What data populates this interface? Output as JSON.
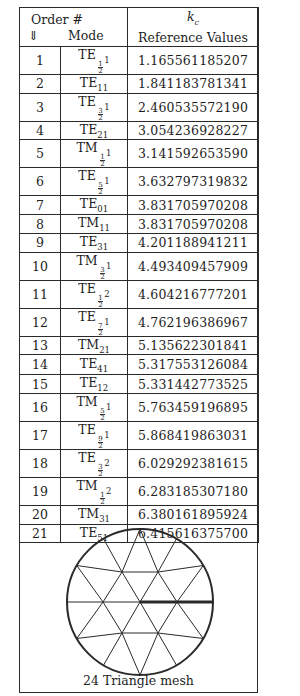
{
  "table": {
    "header": {
      "order_label": "Order #",
      "order_arrow": "⇓",
      "mode_label": "Mode",
      "kc_symbol": "k",
      "kc_subscript": "c",
      "values_label": "Reference Values"
    },
    "rows": [
      {
        "order": "1",
        "base": "TE",
        "frac": [
          "1",
          "2"
        ],
        "idx": "1",
        "value": "1.165561185207"
      },
      {
        "order": "2",
        "base": "TE",
        "sub": "11",
        "value": "1.841183781341"
      },
      {
        "order": "3",
        "base": "TE",
        "frac": [
          "3",
          "2"
        ],
        "idx": "1",
        "value": "2.460535572190"
      },
      {
        "order": "4",
        "base": "TE",
        "sub": "21",
        "value": "3.054236928227"
      },
      {
        "order": "5",
        "base": "TM",
        "frac": [
          "1",
          "2"
        ],
        "idx": "1",
        "value": "3.141592653590"
      },
      {
        "order": "6",
        "base": "TE",
        "frac": [
          "5",
          "2"
        ],
        "idx": "1",
        "value": "3.632797319832"
      },
      {
        "order": "7",
        "base": "TE",
        "sub": "01",
        "value": "3.831705970208"
      },
      {
        "order": "8",
        "base": "TM",
        "sub": "11",
        "value": "3.831705970208"
      },
      {
        "order": "9",
        "base": "TE",
        "sub": "31",
        "value": "4.201188941211"
      },
      {
        "order": "10",
        "base": "TM",
        "frac": [
          "3",
          "2"
        ],
        "idx": "1",
        "value": "4.493409457909"
      },
      {
        "order": "11",
        "base": "TE",
        "frac": [
          "1",
          "2"
        ],
        "idx": "2",
        "value": "4.604216777201"
      },
      {
        "order": "12",
        "base": "TE",
        "frac": [
          "7",
          "2"
        ],
        "idx": "1",
        "value": "4.762196386967"
      },
      {
        "order": "13",
        "base": "TM",
        "sub": "21",
        "value": "5.135622301841"
      },
      {
        "order": "14",
        "base": "TE",
        "sub": "41",
        "value": "5.317553126084"
      },
      {
        "order": "15",
        "base": "TE",
        "sub": "12",
        "value": "5.331442773525"
      },
      {
        "order": "16",
        "base": "TM",
        "frac": [
          "5",
          "2"
        ],
        "idx": "1",
        "value": "5.763459196895"
      },
      {
        "order": "17",
        "base": "TE",
        "frac": [
          "9",
          "2"
        ],
        "idx": "1",
        "value": "5.868419863031"
      },
      {
        "order": "18",
        "base": "TE",
        "frac": [
          "3",
          "2"
        ],
        "idx": "2",
        "value": "6.029292381615"
      },
      {
        "order": "19",
        "base": "TM",
        "frac": [
          "1",
          "2"
        ],
        "idx": "2",
        "value": "6.283185307180"
      },
      {
        "order": "20",
        "base": "TM",
        "sub": "31",
        "value": "6.380161895924"
      },
      {
        "order": "21",
        "base": "TE",
        "sub": "51",
        "value": "6.415616375700"
      }
    ],
    "row_heights": [
      26,
      18,
      26,
      18,
      26,
      24,
      19,
      19,
      18,
      28,
      25,
      27,
      17,
      20,
      19,
      26,
      25,
      25,
      26,
      17,
      18
    ]
  },
  "figure": {
    "caption": "24 Triangle mesh",
    "circle": {
      "cx": 121,
      "cy": 89,
      "r": 73
    },
    "stroke_color": "#2a2a2a"
  }
}
